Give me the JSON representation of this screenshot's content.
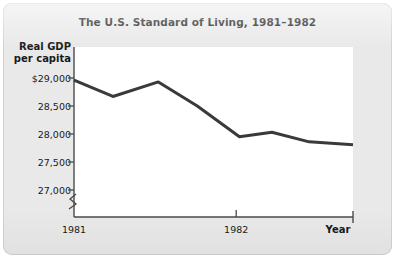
{
  "chart_data": {
    "type": "line",
    "title": "The U.S. Standard of Living, 1981–1982",
    "xlabel": "Year",
    "ylabel": "Real GDP per capita",
    "ylabel_line1": "Real GDP",
    "ylabel_line2": "per capita",
    "ylim": [
      26800,
      29180
    ],
    "y_axis_break": true,
    "y_axis_break_symbol": "zigzag",
    "grid": false,
    "legend": "none",
    "line_color": "#3a3a3a",
    "plot_background": "#ffffff",
    "card_background": "#e9e9e9",
    "yticks": [
      29000,
      28500,
      28000,
      27500,
      27000
    ],
    "ytick_labels": [
      "$29,000",
      "28,500",
      "28,000",
      "27,500",
      "27,000"
    ],
    "xticks": [
      1981.0,
      1982.0
    ],
    "xtick_labels": [
      "1981",
      "1982"
    ],
    "xlim": [
      1981.0,
      1982.72
    ],
    "series": [
      {
        "name": "Real GDP per capita",
        "x": [
          1981.0,
          1981.24,
          1981.52,
          1981.76,
          1982.02,
          1982.22,
          1982.45,
          1982.72
        ],
        "values": [
          28960,
          28670,
          28930,
          28500,
          27950,
          28030,
          27860,
          27810
        ]
      }
    ]
  }
}
